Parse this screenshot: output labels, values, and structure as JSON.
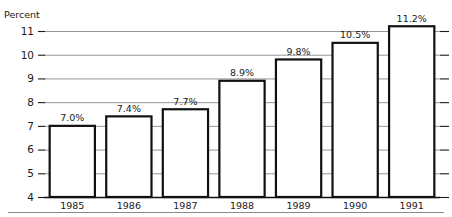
{
  "chart_data": {
    "type": "bar",
    "title": "",
    "ylabel": "Percent",
    "xlabel": "",
    "categories": [
      "1985",
      "1986",
      "1987",
      "1988",
      "1989",
      "1990",
      "1991"
    ],
    "values": [
      7.0,
      7.4,
      7.7,
      8.9,
      9.8,
      10.5,
      11.2
    ],
    "value_labels": [
      "7.0%",
      "7.4%",
      "7.7%",
      "8.9%",
      "9.8%",
      "10.5%",
      "11.2%"
    ],
    "ylim": [
      4,
      11
    ],
    "ytick_labels": [
      "4",
      "5",
      "6",
      "7",
      "8",
      "9",
      "10",
      "11"
    ],
    "ytick_values": [
      4,
      5,
      6,
      7,
      8,
      9,
      10,
      11
    ],
    "grid": true,
    "grid_axis": "y",
    "legend": "none",
    "series": [
      {
        "name": "Percent",
        "values": [
          7.0,
          7.4,
          7.7,
          8.9,
          9.8,
          10.5,
          11.2
        ]
      }
    ],
    "colors": {
      "bar_fill": "#ffffff",
      "bar_stroke": "#111111",
      "gridline": "#8a8a8a",
      "text": "#1a1a1a"
    }
  }
}
